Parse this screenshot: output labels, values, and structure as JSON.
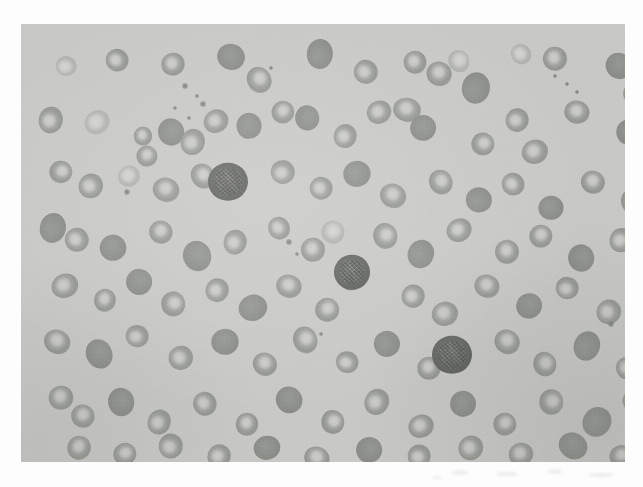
{
  "document": {
    "kind": "photomicrograph",
    "subject": "peripheral blood smear",
    "modality": "light microscopy",
    "staining": "Romanowsky / Wright-Giemsa (reproduced in greyscale)",
    "caption": ""
  },
  "plate": {
    "x": 21,
    "y": 24,
    "width": 604,
    "height": 438,
    "background_color": "#c8c9c6",
    "page_color": "#fdfdfd",
    "has_border": false
  },
  "palette": {
    "page": "#fdfdfd",
    "field_background": "#c8c9c6",
    "rbc_membrane": "#92948f",
    "rbc_central_pallor": "#cdcec9",
    "rbc_dark": "#8d8f8a",
    "rbc_pale": "#b0b2ad",
    "wbc_nucleus": "#686a65",
    "platelet": "#76786f"
  },
  "field_summary": {
    "red_blood_cells": 108,
    "white_blood_cells": 3,
    "platelets": 14,
    "rbc_note": "normocytic cells with prominent central pallor; many overlapping doublets and triplets",
    "wbc_note": "three darkly stained leukocytes with dense granular chromatin"
  },
  "cells": {
    "rbc": [
      {
        "x": 45,
        "y": 42,
        "r": 11,
        "t": "pale"
      },
      {
        "x": 96,
        "y": 36,
        "r": 12,
        "t": "ring"
      },
      {
        "x": 152,
        "y": 40,
        "r": 12,
        "t": "ring"
      },
      {
        "x": 210,
        "y": 33,
        "r": 14,
        "t": "dark"
      },
      {
        "x": 238,
        "y": 56,
        "r": 13,
        "t": "ring"
      },
      {
        "x": 299,
        "y": 30,
        "r": 14,
        "t": "dark"
      },
      {
        "x": 345,
        "y": 48,
        "r": 13,
        "t": "ring"
      },
      {
        "x": 394,
        "y": 38,
        "r": 12,
        "t": "ring"
      },
      {
        "x": 418,
        "y": 50,
        "r": 13,
        "t": "ring"
      },
      {
        "x": 438,
        "y": 37,
        "r": 11,
        "t": "pale"
      },
      {
        "x": 455,
        "y": 64,
        "r": 15,
        "t": "dark"
      },
      {
        "x": 500,
        "y": 30,
        "r": 11,
        "t": "pale"
      },
      {
        "x": 534,
        "y": 35,
        "r": 13,
        "t": "ring"
      },
      {
        "x": 598,
        "y": 42,
        "r": 14,
        "t": "dark"
      },
      {
        "x": 614,
        "y": 70,
        "r": 12,
        "t": "ring"
      },
      {
        "x": 30,
        "y": 96,
        "r": 13,
        "t": "ring"
      },
      {
        "x": 76,
        "y": 98,
        "r": 12,
        "t": "pale"
      },
      {
        "x": 122,
        "y": 112,
        "r": 10,
        "t": "ring"
      },
      {
        "x": 126,
        "y": 132,
        "r": 11,
        "t": "ring"
      },
      {
        "x": 150,
        "y": 108,
        "r": 14,
        "t": "dark"
      },
      {
        "x": 172,
        "y": 118,
        "r": 13,
        "t": "ring"
      },
      {
        "x": 195,
        "y": 97,
        "r": 12,
        "t": "ring"
      },
      {
        "x": 228,
        "y": 102,
        "r": 14,
        "t": "dark"
      },
      {
        "x": 262,
        "y": 88,
        "r": 12,
        "t": "ring"
      },
      {
        "x": 286,
        "y": 94,
        "r": 13,
        "t": "dark"
      },
      {
        "x": 324,
        "y": 112,
        "r": 12,
        "t": "ring"
      },
      {
        "x": 358,
        "y": 88,
        "r": 12,
        "t": "ring"
      },
      {
        "x": 386,
        "y": 86,
        "r": 13,
        "t": "ring"
      },
      {
        "x": 402,
        "y": 104,
        "r": 14,
        "t": "dark"
      },
      {
        "x": 462,
        "y": 120,
        "r": 12,
        "t": "ring"
      },
      {
        "x": 496,
        "y": 96,
        "r": 12,
        "t": "ring"
      },
      {
        "x": 514,
        "y": 128,
        "r": 13,
        "t": "ring"
      },
      {
        "x": 556,
        "y": 88,
        "r": 12,
        "t": "ring"
      },
      {
        "x": 608,
        "y": 108,
        "r": 14,
        "t": "dark"
      },
      {
        "x": 40,
        "y": 148,
        "r": 12,
        "t": "ring"
      },
      {
        "x": 70,
        "y": 162,
        "r": 13,
        "t": "ring"
      },
      {
        "x": 108,
        "y": 152,
        "r": 11,
        "t": "pale"
      },
      {
        "x": 145,
        "y": 166,
        "r": 13,
        "t": "ring"
      },
      {
        "x": 182,
        "y": 152,
        "r": 12,
        "t": "ring"
      },
      {
        "x": 262,
        "y": 148,
        "r": 13,
        "t": "ring"
      },
      {
        "x": 300,
        "y": 164,
        "r": 12,
        "t": "ring"
      },
      {
        "x": 336,
        "y": 150,
        "r": 14,
        "t": "dark"
      },
      {
        "x": 372,
        "y": 172,
        "r": 13,
        "t": "ring"
      },
      {
        "x": 420,
        "y": 158,
        "r": 12,
        "t": "ring"
      },
      {
        "x": 458,
        "y": 176,
        "r": 14,
        "t": "dark"
      },
      {
        "x": 492,
        "y": 160,
        "r": 12,
        "t": "ring"
      },
      {
        "x": 530,
        "y": 184,
        "r": 13,
        "t": "dark"
      },
      {
        "x": 572,
        "y": 158,
        "r": 12,
        "t": "ring"
      },
      {
        "x": 612,
        "y": 178,
        "r": 13,
        "t": "ring"
      },
      {
        "x": 32,
        "y": 204,
        "r": 14,
        "t": "dark"
      },
      {
        "x": 56,
        "y": 216,
        "r": 13,
        "t": "ring"
      },
      {
        "x": 92,
        "y": 224,
        "r": 14,
        "t": "dark"
      },
      {
        "x": 140,
        "y": 208,
        "r": 12,
        "t": "ring"
      },
      {
        "x": 176,
        "y": 232,
        "r": 15,
        "t": "dark"
      },
      {
        "x": 214,
        "y": 218,
        "r": 12,
        "t": "ring"
      },
      {
        "x": 258,
        "y": 204,
        "r": 12,
        "t": "ring"
      },
      {
        "x": 292,
        "y": 226,
        "r": 13,
        "t": "ring"
      },
      {
        "x": 312,
        "y": 208,
        "r": 12,
        "t": "pale"
      },
      {
        "x": 364,
        "y": 212,
        "r": 13,
        "t": "ring"
      },
      {
        "x": 400,
        "y": 230,
        "r": 14,
        "t": "dark"
      },
      {
        "x": 438,
        "y": 206,
        "r": 12,
        "t": "ring"
      },
      {
        "x": 486,
        "y": 228,
        "r": 13,
        "t": "ring"
      },
      {
        "x": 520,
        "y": 212,
        "r": 12,
        "t": "ring"
      },
      {
        "x": 560,
        "y": 234,
        "r": 14,
        "t": "dark"
      },
      {
        "x": 600,
        "y": 216,
        "r": 12,
        "t": "ring"
      },
      {
        "x": 44,
        "y": 262,
        "r": 13,
        "t": "ring"
      },
      {
        "x": 84,
        "y": 276,
        "r": 12,
        "t": "ring"
      },
      {
        "x": 118,
        "y": 258,
        "r": 14,
        "t": "dark"
      },
      {
        "x": 152,
        "y": 280,
        "r": 13,
        "t": "ring"
      },
      {
        "x": 196,
        "y": 266,
        "r": 12,
        "t": "ring"
      },
      {
        "x": 232,
        "y": 284,
        "r": 14,
        "t": "dark"
      },
      {
        "x": 268,
        "y": 262,
        "r": 12,
        "t": "ring"
      },
      {
        "x": 306,
        "y": 286,
        "r": 13,
        "t": "ring"
      },
      {
        "x": 330,
        "y": 254,
        "r": 13,
        "t": "dark"
      },
      {
        "x": 392,
        "y": 272,
        "r": 12,
        "t": "ring"
      },
      {
        "x": 424,
        "y": 290,
        "r": 13,
        "t": "ring"
      },
      {
        "x": 466,
        "y": 262,
        "r": 12,
        "t": "ring"
      },
      {
        "x": 508,
        "y": 282,
        "r": 14,
        "t": "dark"
      },
      {
        "x": 546,
        "y": 264,
        "r": 12,
        "t": "ring"
      },
      {
        "x": 588,
        "y": 288,
        "r": 13,
        "t": "ring"
      },
      {
        "x": 616,
        "y": 262,
        "r": 12,
        "t": "pale"
      },
      {
        "x": 36,
        "y": 318,
        "r": 13,
        "t": "ring"
      },
      {
        "x": 78,
        "y": 330,
        "r": 14,
        "t": "dark"
      },
      {
        "x": 116,
        "y": 312,
        "r": 12,
        "t": "ring"
      },
      {
        "x": 160,
        "y": 334,
        "r": 13,
        "t": "ring"
      },
      {
        "x": 204,
        "y": 318,
        "r": 14,
        "t": "dark"
      },
      {
        "x": 244,
        "y": 340,
        "r": 12,
        "t": "ring"
      },
      {
        "x": 284,
        "y": 316,
        "r": 13,
        "t": "ring"
      },
      {
        "x": 326,
        "y": 338,
        "r": 12,
        "t": "ring"
      },
      {
        "x": 366,
        "y": 320,
        "r": 14,
        "t": "dark"
      },
      {
        "x": 408,
        "y": 344,
        "r": 12,
        "t": "ring"
      },
      {
        "x": 486,
        "y": 318,
        "r": 13,
        "t": "ring"
      },
      {
        "x": 524,
        "y": 340,
        "r": 12,
        "t": "ring"
      },
      {
        "x": 566,
        "y": 322,
        "r": 14,
        "t": "dark"
      },
      {
        "x": 606,
        "y": 344,
        "r": 12,
        "t": "ring"
      },
      {
        "x": 40,
        "y": 374,
        "r": 13,
        "t": "ring"
      },
      {
        "x": 62,
        "y": 392,
        "r": 12,
        "t": "ring"
      },
      {
        "x": 100,
        "y": 378,
        "r": 14,
        "t": "dark"
      },
      {
        "x": 138,
        "y": 398,
        "r": 12,
        "t": "ring"
      },
      {
        "x": 184,
        "y": 380,
        "r": 13,
        "t": "ring"
      },
      {
        "x": 226,
        "y": 400,
        "r": 12,
        "t": "ring"
      },
      {
        "x": 268,
        "y": 376,
        "r": 14,
        "t": "dark"
      },
      {
        "x": 312,
        "y": 398,
        "r": 12,
        "t": "ring"
      },
      {
        "x": 356,
        "y": 378,
        "r": 13,
        "t": "ring"
      },
      {
        "x": 400,
        "y": 402,
        "r": 12,
        "t": "ring"
      },
      {
        "x": 442,
        "y": 380,
        "r": 14,
        "t": "dark"
      },
      {
        "x": 484,
        "y": 400,
        "r": 12,
        "t": "ring"
      },
      {
        "x": 530,
        "y": 378,
        "r": 13,
        "t": "ring"
      },
      {
        "x": 576,
        "y": 398,
        "r": 15,
        "t": "dark"
      },
      {
        "x": 614,
        "y": 376,
        "r": 12,
        "t": "ring"
      },
      {
        "x": 58,
        "y": 424,
        "r": 13,
        "t": "ring"
      },
      {
        "x": 104,
        "y": 430,
        "r": 12,
        "t": "ring"
      },
      {
        "x": 150,
        "y": 422,
        "r": 13,
        "t": "ring"
      },
      {
        "x": 198,
        "y": 432,
        "r": 12,
        "t": "ring"
      },
      {
        "x": 246,
        "y": 424,
        "r": 13,
        "t": "dark"
      },
      {
        "x": 296,
        "y": 434,
        "r": 12,
        "t": "ring"
      },
      {
        "x": 348,
        "y": 426,
        "r": 14,
        "t": "dark"
      },
      {
        "x": 398,
        "y": 432,
        "r": 12,
        "t": "ring"
      },
      {
        "x": 450,
        "y": 424,
        "r": 13,
        "t": "ring"
      },
      {
        "x": 500,
        "y": 430,
        "r": 12,
        "t": "ring"
      },
      {
        "x": 552,
        "y": 422,
        "r": 14,
        "t": "dark"
      },
      {
        "x": 600,
        "y": 432,
        "r": 12,
        "t": "ring"
      }
    ],
    "wbc": [
      {
        "x": 207,
        "y": 158,
        "r": 20,
        "label": "leukocyte-1"
      },
      {
        "x": 331,
        "y": 248,
        "r": 18,
        "label": "leukocyte-2"
      },
      {
        "x": 431,
        "y": 331,
        "r": 20,
        "label": "leukocyte-3"
      }
    ],
    "platelets": [
      {
        "x": 164,
        "y": 62,
        "r": 3
      },
      {
        "x": 176,
        "y": 72,
        "r": 2
      },
      {
        "x": 182,
        "y": 80,
        "r": 3
      },
      {
        "x": 154,
        "y": 84,
        "r": 2
      },
      {
        "x": 168,
        "y": 94,
        "r": 2
      },
      {
        "x": 250,
        "y": 44,
        "r": 2
      },
      {
        "x": 268,
        "y": 218,
        "r": 3
      },
      {
        "x": 276,
        "y": 230,
        "r": 2
      },
      {
        "x": 106,
        "y": 168,
        "r": 3
      },
      {
        "x": 534,
        "y": 52,
        "r": 2
      },
      {
        "x": 546,
        "y": 60,
        "r": 2
      },
      {
        "x": 556,
        "y": 68,
        "r": 2
      },
      {
        "x": 590,
        "y": 300,
        "r": 3
      },
      {
        "x": 300,
        "y": 310,
        "r": 2
      }
    ]
  }
}
